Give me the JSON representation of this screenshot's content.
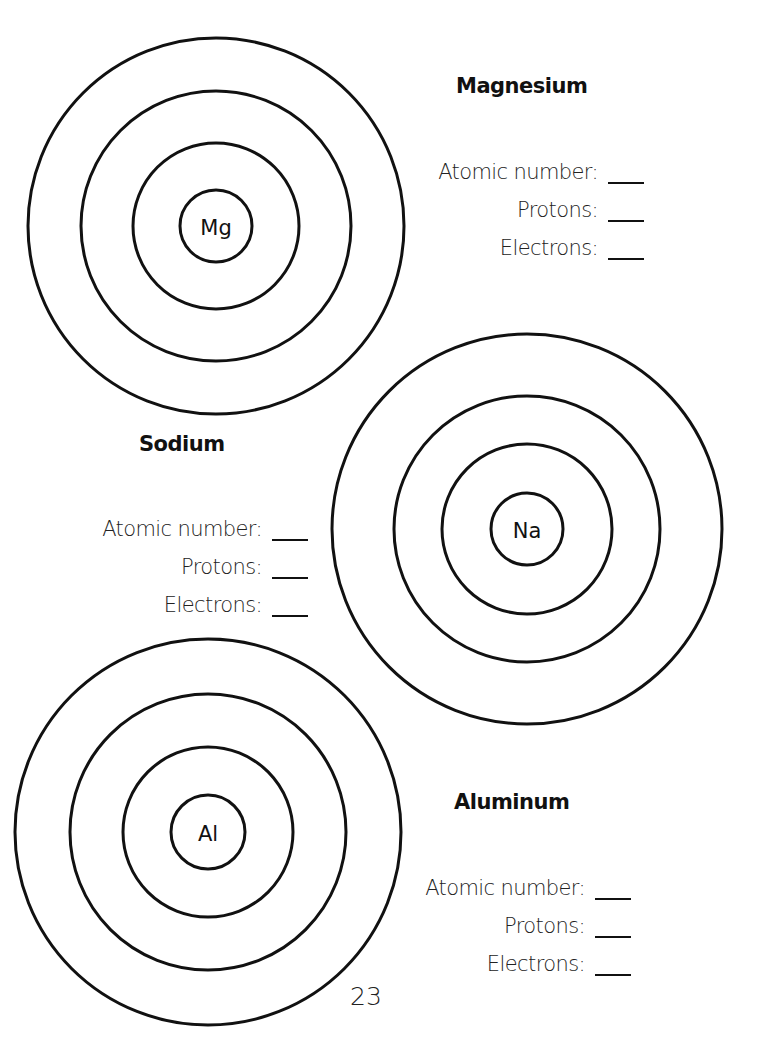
{
  "page": {
    "number": "23"
  },
  "atoms": [
    {
      "name": "Magnesium",
      "symbol": "Mg",
      "center": [
        216,
        226
      ],
      "shell_radii": [
        188,
        135,
        83
      ],
      "nucleus_radius": 36,
      "fields": [
        {
          "label": "Atomic number:",
          "value": ""
        },
        {
          "label": "Protons:",
          "value": ""
        },
        {
          "label": "Electrons:",
          "value": ""
        }
      ]
    },
    {
      "name": "Sodium",
      "symbol": "Na",
      "center": [
        527,
        529
      ],
      "shell_radii": [
        195,
        133,
        85
      ],
      "nucleus_radius": 36,
      "fields": [
        {
          "label": "Atomic number:",
          "value": ""
        },
        {
          "label": "Protons:",
          "value": ""
        },
        {
          "label": "Electrons:",
          "value": ""
        }
      ]
    },
    {
      "name": "Aluminum",
      "symbol": "Al",
      "center": [
        208,
        832
      ],
      "shell_radii": [
        193,
        138,
        85
      ],
      "nucleus_radius": 37,
      "fields": [
        {
          "label": "Atomic number:",
          "value": ""
        },
        {
          "label": "Protons:",
          "value": ""
        },
        {
          "label": "Electrons:",
          "value": ""
        }
      ]
    }
  ],
  "colors": {
    "ink": "#111111",
    "paper": "#ffffff"
  }
}
